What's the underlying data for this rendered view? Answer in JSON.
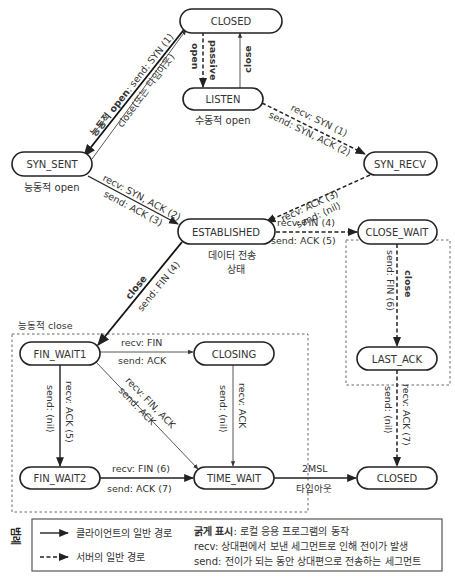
{
  "diagram": {
    "states": {
      "closed_top": "CLOSED",
      "listen": "LISTEN",
      "syn_sent": "SYN_SENT",
      "syn_recv": "SYN_RECV",
      "established": "ESTABLISHED",
      "close_wait": "CLOSE_WAIT",
      "fin_wait1": "FIN_WAIT1",
      "closing": "CLOSING",
      "last_ack": "LAST_ACK",
      "fin_wait2": "FIN_WAIT2",
      "time_wait": "TIME_WAIT",
      "closed_bottom": "CLOSED"
    },
    "state_captions": {
      "listen": "수동적 open",
      "syn_sent": "능동적 open",
      "established_line1": "데이터 전송",
      "established_line2": "상태",
      "passive_close_group": "수동적 close",
      "active_close_group": "능동적 close"
    },
    "transitions": {
      "closed_to_syn_sent_a": "능동적 open",
      "closed_to_syn_sent_b": ": send: SYN (1)",
      "syn_sent_to_closed": "close(또는 타임아웃)",
      "closed_to_listen_a": "passive",
      "closed_to_listen_b": "open",
      "listen_to_closed": "close",
      "listen_to_syn_recv_recv": "recv: SYN  (1)",
      "listen_to_syn_recv_send": "send: SYN, ACK (2)",
      "syn_sent_to_est_recv": "recv: SYN, ACK (2)",
      "syn_sent_to_est_send": "send: ACK (3)",
      "syn_recv_to_est_recv": "recv: ACK (3)",
      "syn_recv_to_est_send": "send: ⟨nil⟩",
      "est_to_close_wait_recv": "recv: FIN (4)",
      "est_to_close_wait_send": "send: ACK (5)",
      "close_wait_to_last_ack_a": "close",
      "close_wait_to_last_ack_b": "send: FIN (6)",
      "est_to_fin_wait1_a": "close",
      "est_to_fin_wait1_b": "send: FIN (4)",
      "fw1_to_closing_recv": "recv: FIN",
      "fw1_to_closing_send": "send: ACK",
      "fw1_to_fw2_recv": "recv: ACK (5)",
      "fw1_to_fw2_send": "send: ⟨nil⟩",
      "fw1_to_time_wait_recv": "recv: FIN, ACK",
      "fw1_to_time_wait_send": "send: ACK",
      "closing_to_time_wait_recv": "recv: ACK",
      "closing_to_time_wait_send": "send: ⟨nil⟩",
      "fw2_to_time_wait_recv": "recv: FIN (6)",
      "fw2_to_time_wait_send": "send: ACK (7)",
      "last_ack_to_closed_recv": "recv: ACK (7)",
      "last_ack_to_closed_send": "send: ⟨nil⟩",
      "time_wait_to_closed_a": "2MSL",
      "time_wait_to_closed_b": "타임아웃"
    },
    "legend": {
      "title": "범례",
      "client_path": "클라이언트의 일반 경로",
      "server_path": "서버의 일반 경로",
      "bold_label": "굵게 표시",
      "bold_desc": ": 로컬 응용 프로그램의 동작",
      "recv_label": "recv",
      "recv_desc": ": 상대편에서 보낸 세그먼트로 인해 전이가 발생",
      "send_label": "send",
      "send_desc": ": 전이가 되는 동안 상대편으로 전송하는 세그먼트"
    }
  }
}
